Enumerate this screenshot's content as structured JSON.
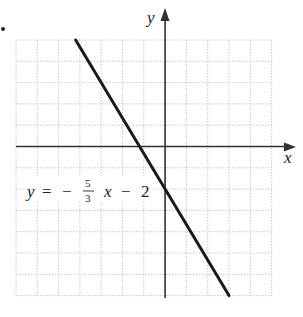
{
  "chart_data": {
    "type": "line",
    "title": "",
    "xlabel": "x",
    "ylabel": "y",
    "xlim": [
      -7,
      5
    ],
    "ylim": [
      -7,
      5
    ],
    "grid": true,
    "grid_step": 1,
    "series": [
      {
        "name": "y = -5/3 x - 2",
        "slope": -1.6667,
        "intercept": -2,
        "points": [
          [
            -4.2,
            5
          ],
          [
            0,
            -2
          ],
          [
            3,
            -7
          ]
        ]
      }
    ],
    "annotations": [
      {
        "text": "y = − 5/3 x − 2",
        "x": -6.5,
        "y": -2
      }
    ]
  },
  "labels": {
    "x_axis": "x",
    "y_axis": "y",
    "eq_y": "y",
    "eq_eq": "=",
    "eq_minus": "−",
    "eq_num": "5",
    "eq_den": "3",
    "eq_x": "x",
    "eq_minus2": "−",
    "eq_const": "2"
  },
  "colors": {
    "grid": "#b8b8b8",
    "axis": "#333333",
    "line": "#1a1a1a"
  }
}
